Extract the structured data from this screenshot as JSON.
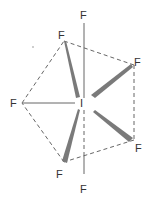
{
  "molecule": {
    "formula": "IF7",
    "geometry": "pentagonal bipyramidal",
    "central_atom": {
      "symbol": "I",
      "x": 83,
      "y": 103
    },
    "colors": {
      "bond": "#666666",
      "wedge": "#7a7a7a",
      "dashed": "#555555",
      "text": "#333333"
    },
    "atoms": [
      {
        "id": "f-axial-top",
        "symbol": "F",
        "label_x": 84,
        "label_y": 19
      },
      {
        "id": "f-axial-bottom",
        "symbol": "F",
        "label_x": 84,
        "label_y": 191
      },
      {
        "id": "f-upper-left",
        "symbol": "F",
        "label_x": 61,
        "label_y": 39
      },
      {
        "id": "f-upper-right",
        "symbol": "F",
        "label_x": 137,
        "label_y": 65
      },
      {
        "id": "f-left",
        "symbol": "F",
        "label_x": 13,
        "label_y": 107
      },
      {
        "id": "f-lower-right",
        "symbol": "F",
        "label_x": 139,
        "label_y": 151
      },
      {
        "id": "f-lower-left",
        "symbol": "F",
        "label_x": 59,
        "label_y": 177
      }
    ]
  }
}
